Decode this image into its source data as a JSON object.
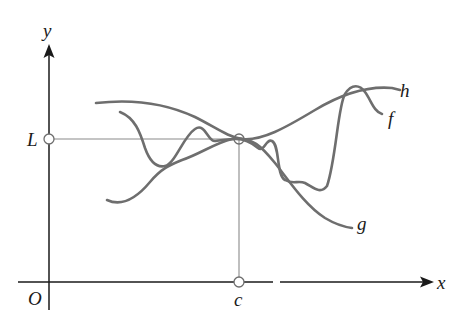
{
  "figure": {
    "axes": {
      "x_label": "x",
      "y_label": "y",
      "origin_label": "O"
    },
    "markers": {
      "L_label": "L",
      "c_label": "c"
    },
    "curves": [
      {
        "name": "h",
        "label": "h",
        "role": "upper bound"
      },
      {
        "name": "f",
        "label": "f",
        "role": "squeezed function"
      },
      {
        "name": "g",
        "label": "g",
        "role": "lower bound"
      }
    ],
    "colors": {
      "curve": "#6e6e6e",
      "axis": "#1a1a1a",
      "guide": "#8a8a8a",
      "text": "#1a1a1a"
    }
  }
}
